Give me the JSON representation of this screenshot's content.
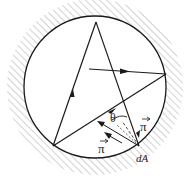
{
  "diagram": {
    "type": "radiation-cavity-ray-diagram",
    "labels": {
      "theta": "θ",
      "pi_vector_right": "π",
      "pi_vector_left": "π",
      "area_element": "dA"
    },
    "colors": {
      "line": "#1a1a1a",
      "hatch": "#9a9a9a",
      "background": "#ffffff"
    },
    "geometry": {
      "circle": {
        "cx": 95,
        "cy": 87,
        "r": 71
      },
      "points": {
        "top": [
          96,
          22
        ],
        "right": [
          166,
          74
        ],
        "bottom_left": [
          53,
          146
        ],
        "dA": [
          139,
          146
        ]
      }
    }
  }
}
